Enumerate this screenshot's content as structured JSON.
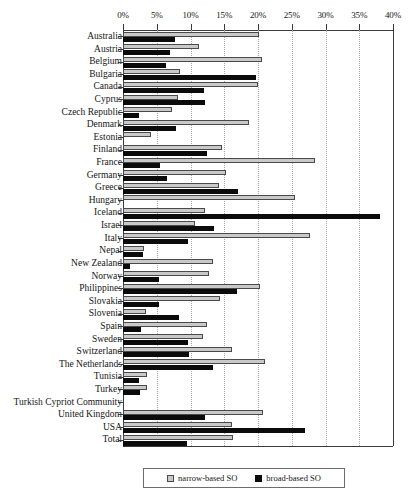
{
  "chart_data": {
    "type": "bar",
    "orientation": "horizontal",
    "title": "",
    "xlabel": "",
    "ylabel": "",
    "xlim": [
      0,
      40
    ],
    "xticks": [
      0,
      5,
      10,
      15,
      20,
      25,
      30,
      35,
      40
    ],
    "xtick_labels": [
      "0%",
      "5%",
      "10%",
      "15%",
      "20%",
      "25%",
      "30%",
      "35%",
      "40%"
    ],
    "grid": "vertical-dotted",
    "legend_position": "bottom-center",
    "legend": [
      "narrow-based SO",
      "broad-based SO"
    ],
    "colors": {
      "narrow-based SO": "#c9c9c9",
      "broad-based SO": "#0b0b0b",
      "axis": "#3a3a3a",
      "gridline": "#a8a8a8"
    },
    "categories": [
      "Australia",
      "Austria",
      "Belgium",
      "Bulgaria",
      "Canada",
      "Cyprus",
      "Czech Republic",
      "Denmark",
      "Estonia",
      "Finland",
      "France",
      "Germany",
      "Greece",
      "Hungary",
      "Iceland",
      "Israel",
      "Italy",
      "Nepal",
      "New Zealand",
      "Norway",
      "Philippines",
      "Slovakia",
      "Slovenia",
      "Spain",
      "Sweden",
      "Switzerland",
      "The Netherlands",
      "Tunisia",
      "Turkey",
      "Turkish Cypriot Community",
      "United Kingdom",
      "USA",
      "Total"
    ],
    "series": [
      {
        "name": "narrow-based SO",
        "values": [
          20.1,
          11.3,
          20.6,
          8.4,
          20.0,
          8.2,
          7.3,
          18.6,
          4.2,
          14.7,
          28.5,
          15.3,
          14.2,
          25.5,
          12.2,
          10.7,
          27.7,
          3.1,
          13.4,
          12.8,
          20.3,
          14.3,
          3.4,
          12.5,
          11.9,
          16.2,
          21.0,
          3.6,
          3.5,
          0.0,
          20.8,
          16.2,
          16.3
        ]
      },
      {
        "name": "broad-based SO",
        "values": [
          7.7,
          6.9,
          6.3,
          19.7,
          12.0,
          12.1,
          2.3,
          7.9,
          0.0,
          12.5,
          5.5,
          6.5,
          17.1,
          0.0,
          38.0,
          13.5,
          9.6,
          3.0,
          1.1,
          5.3,
          16.9,
          5.4,
          8.3,
          2.6,
          9.6,
          9.8,
          13.4,
          2.4,
          2.5,
          0.0,
          12.2,
          26.9,
          9.5
        ]
      }
    ]
  }
}
